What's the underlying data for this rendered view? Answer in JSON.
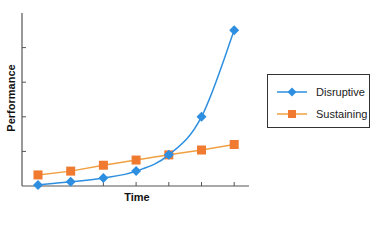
{
  "chart_data": {
    "type": "line",
    "title": "",
    "xlabel": "Time",
    "ylabel": "Performance",
    "x": [
      1,
      2,
      3,
      4,
      5,
      6,
      7
    ],
    "ylim": [
      0,
      5
    ],
    "y_ticks_count": 5,
    "tick_labels_shown": false,
    "grid": false,
    "legend_position": "right",
    "series": [
      {
        "name": "Disruptive",
        "marker": "diamond",
        "color": "#2e8fe0",
        "values": [
          0.03,
          0.12,
          0.23,
          0.43,
          0.9,
          2.0,
          4.5
        ]
      },
      {
        "name": "Sustaining",
        "marker": "square",
        "color": "#f0a040",
        "marker_color": "#f07a30",
        "values": [
          0.32,
          0.43,
          0.6,
          0.75,
          0.9,
          1.04,
          1.2
        ]
      }
    ]
  },
  "labels": {
    "x_axis": "Time",
    "y_axis": "Performance"
  },
  "legend": {
    "items": [
      {
        "label": "Disruptive"
      },
      {
        "label": "Sustaining"
      }
    ]
  }
}
